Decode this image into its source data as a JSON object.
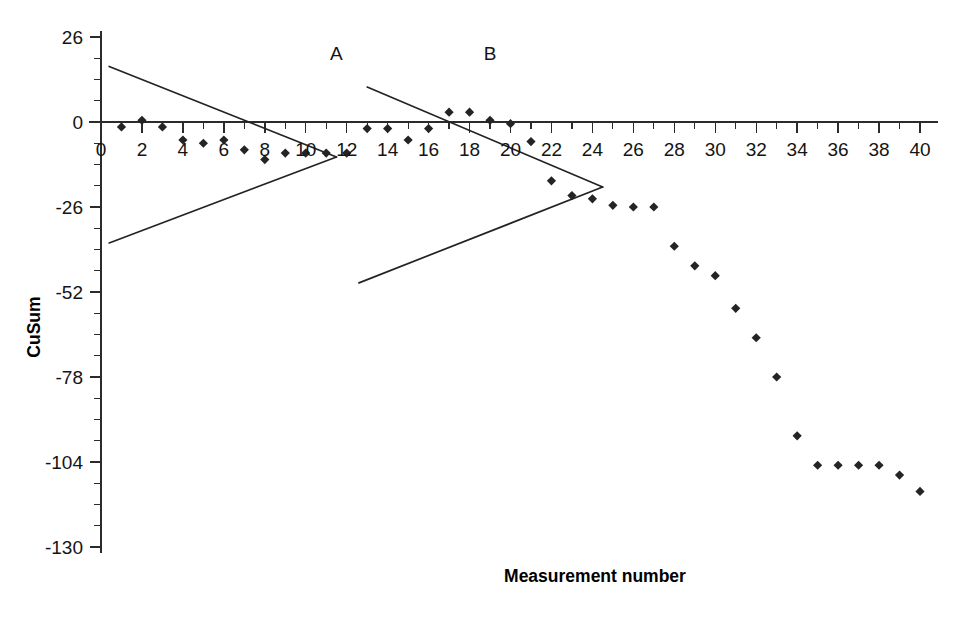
{
  "chart_data": {
    "type": "scatter",
    "title": "",
    "xlabel": "Measurement number",
    "ylabel": "CuSum",
    "xlim": [
      0,
      40
    ],
    "ylim": [
      -130,
      26
    ],
    "grid": false,
    "legend": null,
    "xticks": [
      0,
      2,
      4,
      6,
      8,
      10,
      12,
      14,
      16,
      18,
      20,
      22,
      24,
      26,
      28,
      30,
      32,
      34,
      36,
      38,
      40
    ],
    "xtick_labels": [
      "0",
      "2",
      "4",
      "6",
      "8",
      "10",
      "12",
      "14",
      "16",
      "18",
      "20",
      "22",
      "24",
      "26",
      "28",
      "30",
      "32",
      "34",
      "36",
      "38",
      "40"
    ],
    "xtick_minor_step": 1,
    "yticks": [
      26,
      0,
      -26,
      -52,
      -78,
      -104,
      -130
    ],
    "ytick_labels": [
      "26",
      "0",
      "-26",
      "-52",
      "-78",
      "-104",
      "-130"
    ],
    "ytick_minor_step": 6.5,
    "marker": "diamond",
    "marker_color": "#242424",
    "series": [
      {
        "name": "CuSum",
        "x": [
          1,
          2,
          3,
          4,
          5,
          6,
          7,
          8,
          9,
          10,
          11,
          12,
          13,
          14,
          15,
          16,
          17,
          18,
          19,
          20,
          21,
          22,
          23,
          24,
          25,
          26,
          27,
          28,
          29,
          30,
          31,
          32,
          33,
          34,
          35,
          36,
          37,
          38,
          39,
          40
        ],
        "y": [
          -1.5,
          0.5,
          -1.5,
          -5.5,
          -6.5,
          -5.5,
          -8.5,
          -11.5,
          -9.5,
          -9.5,
          -9.5,
          -9.5,
          -2.0,
          -2.0,
          -5.5,
          -2.0,
          3.0,
          3.0,
          0.5,
          -0.5,
          -6.0,
          -18.0,
          -22.5,
          -23.5,
          -25.5,
          -26.0,
          -26.0,
          -38.0,
          -44.0,
          -47.0,
          -57.0,
          -66.0,
          -78.0,
          -96.0,
          -105.0,
          -105.0,
          -105.0,
          -105.0,
          -108.0,
          -113.0
        ]
      }
    ],
    "annotations": [
      {
        "text": "A",
        "x": 11.5,
        "y": 19.0
      },
      {
        "text": "B",
        "x": 19.0,
        "y": 19.0
      }
    ],
    "vmasks": [
      {
        "label": "A",
        "vertex": {
          "x": 11.5,
          "y": -10.7
        },
        "upper_origin": {
          "x": 0.4,
          "y": 17.0
        },
        "lower_origin": {
          "x": 0.4,
          "y": -37.0
        }
      },
      {
        "label": "B",
        "vertex": {
          "x": 24.5,
          "y": -19.9
        },
        "upper_origin": {
          "x": 13.0,
          "y": 10.7
        },
        "lower_origin": {
          "x": 12.6,
          "y": -49.2
        }
      }
    ]
  },
  "axis_titles": {
    "x": "Measurement number",
    "y": "CuSum"
  }
}
